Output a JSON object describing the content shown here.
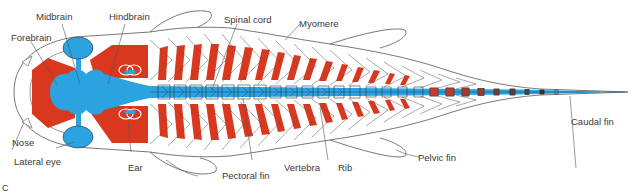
{
  "colors": {
    "muscle": "#d9381e",
    "nervous": "#2aa3e0",
    "outline": "#555555",
    "label_text": "#3a3a3a"
  },
  "labels": {
    "midbrain": "Midbrain",
    "hindbrain": "Hindbrain",
    "forebrain": "Forebrain",
    "spinal_cord": "Spinal cord",
    "myomere": "Myomere",
    "nose": "Nose",
    "lateral_eye": "Lateral eye",
    "ear": "Ear",
    "pectoral_fin": "Pectoral fin",
    "vertebra": "Vertebra",
    "rib": "Rib",
    "pelvic_fin": "Pelvic fin",
    "caudal_fin": "Caudal fin"
  },
  "caption": "C"
}
